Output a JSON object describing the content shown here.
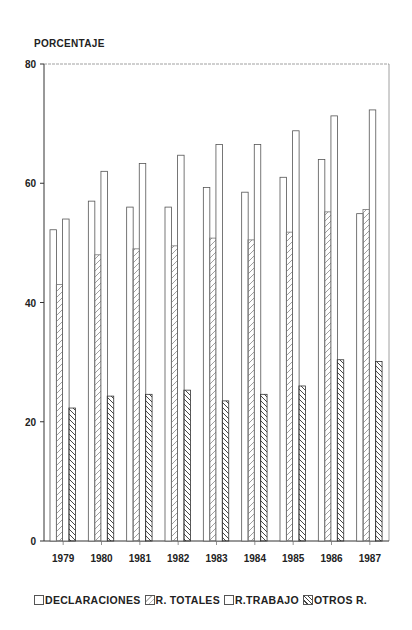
{
  "chart_data": {
    "type": "bar",
    "title": "",
    "xlabel": "",
    "ylabel": "PORCENTAJE",
    "ylim": [
      0,
      80
    ],
    "yticks": [
      0,
      20,
      40,
      60,
      80
    ],
    "grid": false,
    "legend_position": "bottom",
    "categories": [
      "1979",
      "1980",
      "1981",
      "1982",
      "1983",
      "1984",
      "1985",
      "1986",
      "1987"
    ],
    "series": [
      {
        "name": "DECLARACIONES",
        "pattern": "empty",
        "values": [
          52.2,
          57.0,
          56.0,
          56.0,
          59.3,
          58.5,
          61.0,
          64.0,
          54.9
        ]
      },
      {
        "name": "R. TOTALES",
        "pattern": "light-diagonal",
        "values": [
          43.0,
          48.0,
          49.0,
          49.5,
          50.8,
          50.5,
          51.8,
          55.2,
          55.6
        ]
      },
      {
        "name": "R.TRABAJO",
        "pattern": "empty",
        "values": [
          54.0,
          62.0,
          63.3,
          64.7,
          66.5,
          66.5,
          68.8,
          71.3,
          72.3
        ]
      },
      {
        "name": "OTROS R.",
        "pattern": "dense-backslash",
        "values": [
          22.3,
          24.3,
          24.6,
          25.3,
          23.5,
          24.6,
          26.0,
          30.4,
          30.1
        ]
      }
    ]
  },
  "axis": {
    "y_title": "PORCENTAJE",
    "y_ticks": [
      "0",
      "20",
      "40",
      "60",
      "80"
    ]
  },
  "legend": {
    "items": [
      "DECLARACIONES",
      "R. TOTALES",
      "R.TRABAJO",
      "OTROS R."
    ]
  },
  "colors": {
    "ink": "#333333",
    "background": "#ffffff"
  }
}
